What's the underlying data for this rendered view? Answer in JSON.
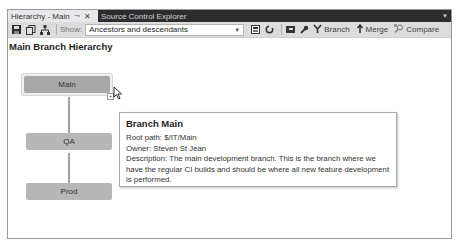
{
  "tabs": {
    "active": {
      "label": "Hierarchy - Main",
      "pin_icon": "pin-icon",
      "close_icon": "close-icon"
    },
    "inactive": {
      "label": "Source Control Explorer"
    }
  },
  "toolbar": {
    "show_label": "Show:",
    "show_value": "Ancestors and descendants",
    "branch_label": "Branch",
    "merge_label": "Merge",
    "compare_label": "Compare"
  },
  "page": {
    "title": "Main Branch Hierarchy"
  },
  "nodes": [
    {
      "label": "Main"
    },
    {
      "label": "QA"
    },
    {
      "label": "Prod"
    }
  ],
  "tooltip": {
    "title": "Branch Main",
    "root_path": "Root path: $/IT/Main",
    "owner": "Owner: Steven St Jean",
    "description": "Description: The main development branch. This is the branch where we have the regular CI builds and should be where all new feature development is performed."
  },
  "colors": {
    "tabbar_bg": "#2d2d30",
    "toolbar_bg": "#dcdcdc",
    "node_bg": "#b7b7b7"
  }
}
